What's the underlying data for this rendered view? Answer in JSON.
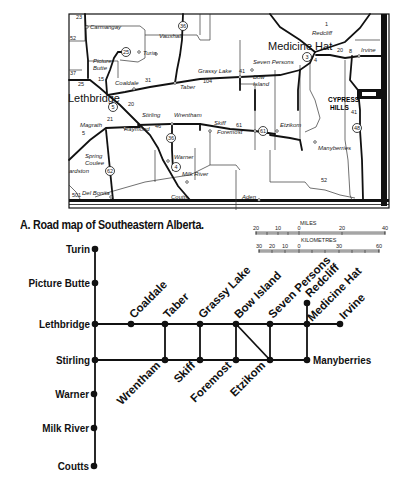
{
  "figure": {
    "caption": "A. Road map of Southeastern Alberta."
  },
  "map": {
    "major_labels": {
      "lethbridge": "Lethbridge",
      "medicine_hat": "Medicine Hat",
      "cypress_hills_1": "CYPRESS",
      "cypress_hills_2": "HILLS"
    },
    "places": {
      "carmangay": "Carmangay",
      "vauxhall": "Vauxhall",
      "turin": "Turin",
      "picture_butte_1": "Picture",
      "picture_butte_2": "Butte",
      "coaldale": "Coaldale",
      "taber": "Taber",
      "grassy_lake": "Grassy Lake",
      "seven_persons": "Seven Persons",
      "bow_island_1": "Bow",
      "bow_island_2": "Island",
      "redcliff": "Redcliff",
      "irvine": "Irvine",
      "stirling": "Stirling",
      "wrentham": "Wrentham",
      "skiff": "Skiff",
      "foremost": "Foremost",
      "etzikom": "Etzikom",
      "manyberries": "Manyberries",
      "magrath": "Magrath",
      "raymond": "Raymond",
      "warner": "Warner",
      "milk_river": "Milk River",
      "spring_coulee_1": "Spring",
      "spring_coulee_2": "Coulee",
      "cardston": "ardston",
      "del_bonita": "Del Bonita",
      "coutts": "Coutts",
      "aden": "Aden"
    },
    "highway_shields": [
      "36",
      "25",
      "5",
      "36",
      "4",
      "62",
      "61",
      "3",
      "48"
    ],
    "road_numbers": [
      "23",
      "52",
      "3",
      "25",
      "15",
      "31",
      "20",
      "21",
      "46",
      "104",
      "61",
      "52",
      "41",
      "20",
      "1",
      "4",
      "8",
      "5",
      "7",
      "501",
      "41"
    ],
    "scale": {
      "miles_title": "MILES",
      "miles_ticks": [
        "20",
        "10",
        "0",
        "20",
        "40"
      ],
      "km_title": "KILOMETRES",
      "km_ticks": [
        "30",
        "20",
        "10",
        "0",
        "30",
        "60"
      ]
    }
  },
  "schematic": {
    "trunk_nodes": [
      {
        "label": "Turin"
      },
      {
        "label": "Picture Butte"
      },
      {
        "label": "Lethbridge"
      },
      {
        "label": "Stirling"
      },
      {
        "label": "Warner"
      },
      {
        "label": "Milk River"
      },
      {
        "label": "Coutts"
      }
    ],
    "north_line_nodes": [
      {
        "label": "Coaldale"
      },
      {
        "label": "Taber"
      },
      {
        "label": "Grassy Lake"
      },
      {
        "label": "Bow Island"
      },
      {
        "label": "Seven Persons"
      },
      {
        "label": "Medicine Hat"
      },
      {
        "label": "Irvine"
      }
    ],
    "redcliff": {
      "label": "Redcliff"
    },
    "south_line_nodes": [
      {
        "label": "Wrentham"
      },
      {
        "label": "Skiff"
      },
      {
        "label": "Foremost"
      },
      {
        "label": "Etzikom"
      },
      {
        "label": "Manyberries"
      }
    ]
  }
}
